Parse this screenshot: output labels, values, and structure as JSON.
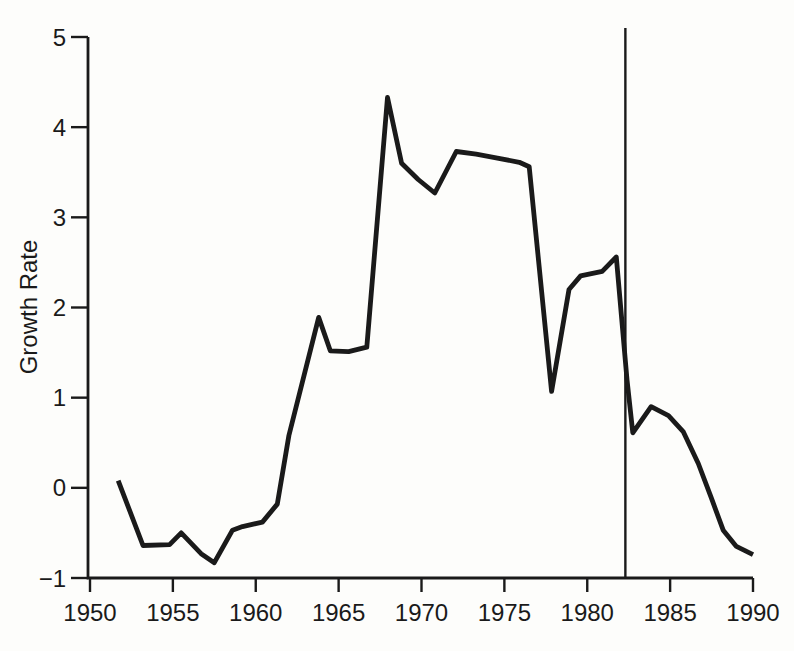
{
  "figure": {
    "background": "#fdfdfb",
    "ink_color": "#1a1a1a"
  },
  "chart_data": {
    "type": "line",
    "title": "",
    "xlabel": "",
    "ylabel": "Growth Rate",
    "xlim": [
      1950,
      1990
    ],
    "ylim": [
      -1,
      5
    ],
    "grid": false,
    "legend": false,
    "x_ticks": [
      {
        "value": 1950,
        "label": "1950"
      },
      {
        "value": 1955,
        "label": "1955"
      },
      {
        "value": 1960,
        "label": "1960"
      },
      {
        "value": 1965,
        "label": "1965"
      },
      {
        "value": 1970,
        "label": "1970"
      },
      {
        "value": 1975,
        "label": "1975"
      },
      {
        "value": 1980,
        "label": "1980"
      },
      {
        "value": 1985,
        "label": "1985"
      },
      {
        "value": 1990,
        "label": "1990"
      }
    ],
    "y_ticks": [
      {
        "value": -1,
        "label": "−1"
      },
      {
        "value": 0,
        "label": "0"
      },
      {
        "value": 1,
        "label": "1"
      },
      {
        "value": 2,
        "label": "2"
      },
      {
        "value": 3,
        "label": "3"
      },
      {
        "value": 4,
        "label": "4"
      },
      {
        "value": 5,
        "label": "5"
      }
    ],
    "series": [
      {
        "name": "Growth Rate",
        "points": [
          [
            1951.7,
            0.08
          ],
          [
            1953.2,
            -0.64
          ],
          [
            1954.8,
            -0.63
          ],
          [
            1955.5,
            -0.5
          ],
          [
            1956.7,
            -0.73
          ],
          [
            1957.5,
            -0.83
          ],
          [
            1958.6,
            -0.47
          ],
          [
            1959.2,
            -0.43
          ],
          [
            1960.4,
            -0.38
          ],
          [
            1961.3,
            -0.18
          ],
          [
            1962.0,
            0.58
          ],
          [
            1963.8,
            1.89
          ],
          [
            1964.5,
            1.52
          ],
          [
            1965.6,
            1.51
          ],
          [
            1966.7,
            1.56
          ],
          [
            1967.95,
            4.33
          ],
          [
            1968.8,
            3.6
          ],
          [
            1969.8,
            3.42
          ],
          [
            1970.8,
            3.27
          ],
          [
            1972.1,
            3.73
          ],
          [
            1973.3,
            3.7
          ],
          [
            1974.5,
            3.66
          ],
          [
            1975.9,
            3.61
          ],
          [
            1976.5,
            3.56
          ],
          [
            1977.85,
            1.07
          ],
          [
            1978.9,
            2.2
          ],
          [
            1979.6,
            2.35
          ],
          [
            1980.9,
            2.4
          ],
          [
            1981.75,
            2.56
          ],
          [
            1982.4,
            1.2
          ],
          [
            1982.75,
            0.61
          ],
          [
            1983.85,
            0.9
          ],
          [
            1984.9,
            0.8
          ],
          [
            1985.8,
            0.62
          ],
          [
            1986.7,
            0.27
          ],
          [
            1987.5,
            -0.12
          ],
          [
            1988.2,
            -0.47
          ],
          [
            1989.0,
            -0.65
          ],
          [
            1990.0,
            -0.74
          ]
        ]
      }
    ],
    "annotations": [
      {
        "type": "vline",
        "x": 1982.3,
        "y_from": -1,
        "y_to": 5.1
      }
    ]
  }
}
